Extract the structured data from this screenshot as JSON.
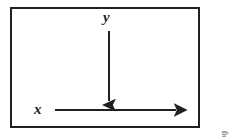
{
  "figure": {
    "name": "coordinate-axes-diagram",
    "background_color": "#ffffff",
    "frame": {
      "stroke_color": "#231f20",
      "stroke_width": 2,
      "x": 10,
      "y": 7,
      "width": 190,
      "height": 121
    },
    "axes": [
      {
        "id": "y-axis",
        "label": "y",
        "direction": "down",
        "stroke_color": "#231f20",
        "stroke_width": 2,
        "x1": 109,
        "y1": 31,
        "x2": 109,
        "y2": 101
      },
      {
        "id": "x-axis",
        "label": "x",
        "direction": "right",
        "stroke_color": "#231f20",
        "stroke_width": 2,
        "x1": 55,
        "y1": 110,
        "x2": 176,
        "y2": 110
      }
    ],
    "labels": {
      "y_label": "y",
      "x_label": "x",
      "label_color": "#231f20"
    },
    "credit": {
      "text": "© 2013 Cengage Learning",
      "color": "#58595b",
      "orientation": "vertical-bottom-to-top"
    }
  }
}
